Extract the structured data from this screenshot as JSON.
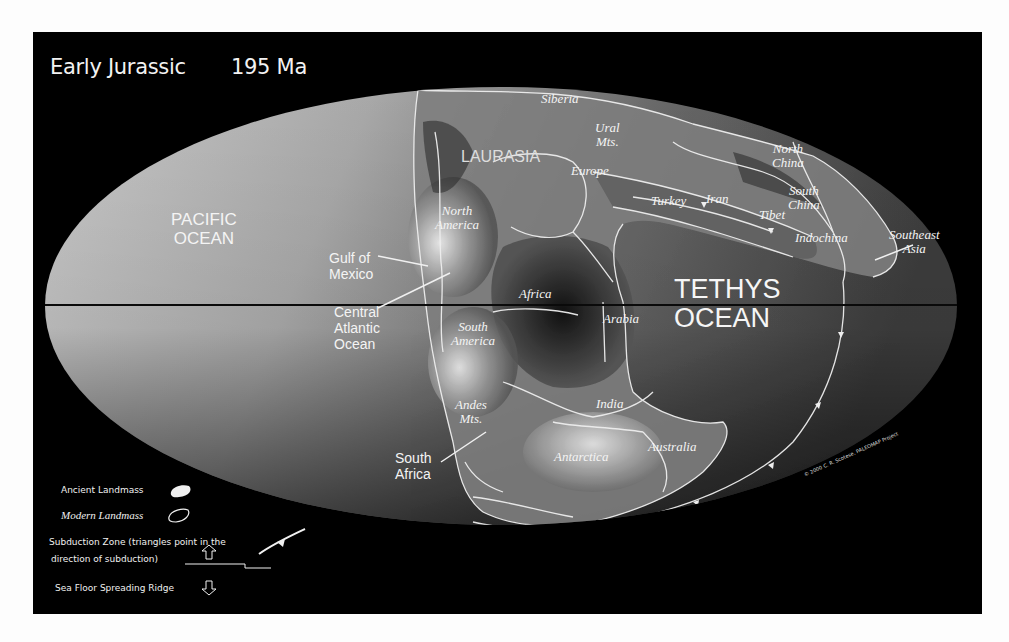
{
  "title": {
    "period": "Early Jurassic",
    "age": "195 Ma"
  },
  "oceans": {
    "pacific": [
      "PACIFIC",
      "OCEAN"
    ],
    "tethys": [
      "TETHYS",
      "OCEAN"
    ],
    "central_atlantic": [
      "Central",
      "Atlantic",
      "Ocean"
    ],
    "gulf_of_mexico": [
      "Gulf of",
      "Mexico"
    ]
  },
  "regions": {
    "siberia": "Siberia",
    "ural": [
      "Ural",
      "Mts."
    ],
    "laurasia": "LAURASIA",
    "europe": "Europe",
    "turkey": "Turkey",
    "iran": "Iran",
    "tibet": "Tibet",
    "north_china": [
      "North",
      "China"
    ],
    "south_china": [
      "South",
      "China"
    ],
    "indochina": "Indochina",
    "southeast_asia": [
      "Southeast",
      "Asia"
    ],
    "north_america": [
      "North",
      "America"
    ],
    "africa": "Africa",
    "arabia": "Arabia",
    "south_america": [
      "South",
      "America"
    ],
    "andes": [
      "Andes",
      "Mts."
    ],
    "india": "India",
    "antarctica": "Antarctica",
    "australia": "Australia",
    "south_africa": [
      "South",
      "Africa"
    ]
  },
  "legend": {
    "ancient_landmass": "Ancient Landmass",
    "modern_landmass": "Modern Landmass",
    "subduction_line1": "Subduction Zone  (triangles point in the",
    "subduction_line2": "direction of subduction)",
    "ridge": "Sea Floor Spreading Ridge"
  },
  "copyright": "© 2000  C. R. Scotese, PALEOMAP Project",
  "colors": {
    "background": "#000000",
    "ocean_light": "#c4c4c4",
    "ocean_dark": "#3a3a3a",
    "outline": "#eeeeee",
    "page": "#fdfdfd"
  }
}
